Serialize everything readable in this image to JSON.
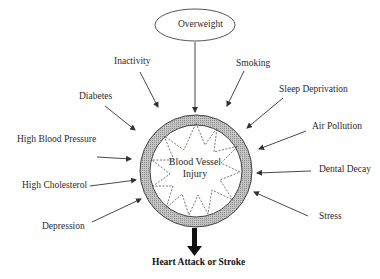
{
  "diagram": {
    "title": "",
    "center": {
      "label_line1": "Blood Vessel",
      "label_line2": "Injury"
    },
    "top_factor": {
      "label": "Overweight",
      "shape": "ellipse"
    },
    "factors": [
      {
        "id": "inactivity",
        "label": "Inactivity"
      },
      {
        "id": "smoking",
        "label": "Smoking"
      },
      {
        "id": "diabetes",
        "label": "Diabetes"
      },
      {
        "id": "sleep-deprivation",
        "label": "Sleep Deprivation"
      },
      {
        "id": "high-blood-pressure",
        "label": "High Blood Pressure"
      },
      {
        "id": "air-pollution",
        "label": "Air Pollution"
      },
      {
        "id": "high-cholesterol",
        "label": "High Cholesterol"
      },
      {
        "id": "dental-decay",
        "label": "Dental Decay"
      },
      {
        "id": "depression",
        "label": "Depression"
      },
      {
        "id": "stress",
        "label": "Stress"
      }
    ],
    "outcome": {
      "label": "Heart Attack or Stroke"
    },
    "colors": {
      "ring_fill": "#b8b8b8",
      "line": "#333333",
      "text": "#2a2a2a"
    }
  }
}
